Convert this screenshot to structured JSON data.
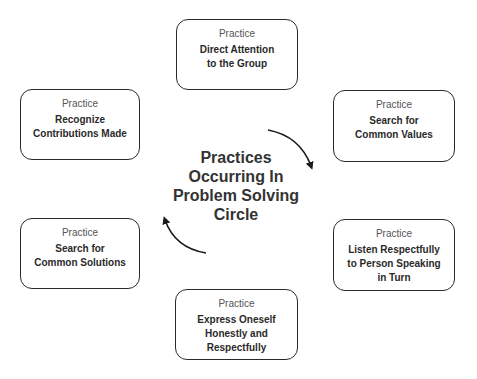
{
  "center": {
    "lines": [
      "Practices",
      "Occurring In",
      "Problem Solving",
      "Circle"
    ]
  },
  "boxes": [
    {
      "id": "top",
      "kicker": "Practice",
      "lines": [
        "Direct Attention",
        "to the Group"
      ]
    },
    {
      "id": "upper-right",
      "kicker": "Practice",
      "lines": [
        "Search for",
        "Common Values"
      ]
    },
    {
      "id": "lower-right",
      "kicker": "Practice",
      "lines": [
        "Listen Respectfully",
        "to Person Speaking",
        "in Turn"
      ]
    },
    {
      "id": "bottom",
      "kicker": "Practice",
      "lines": [
        "Express Oneself",
        "Honestly and",
        "Respectfully"
      ]
    },
    {
      "id": "lower-left",
      "kicker": "Practice",
      "lines": [
        "Search for",
        "Common Solutions"
      ]
    },
    {
      "id": "upper-left",
      "kicker": "Practice",
      "lines": [
        "Recognize",
        "Contributions Made"
      ]
    }
  ],
  "arrows": [
    {
      "name": "clockwise-arrow-top-right",
      "direction": "down"
    },
    {
      "name": "clockwise-arrow-bottom-left",
      "direction": "up"
    }
  ],
  "colors": {
    "stroke": "#2a2a2a",
    "text": "#2a2a2a",
    "kicker": "#555555",
    "background": "#ffffff"
  }
}
